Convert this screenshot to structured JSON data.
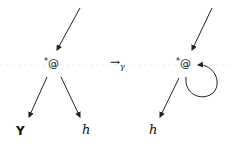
{
  "left_graph": {
    "node": {
      "star": "*",
      "symbol": "@"
    },
    "children": [
      {
        "label": "Y",
        "style": "bold"
      },
      {
        "label": "h",
        "style": "italic"
      }
    ]
  },
  "relation": {
    "arrow": "→",
    "subscript": "γ"
  },
  "right_graph": {
    "node": {
      "star": "*",
      "symbol": "@"
    },
    "children": [
      {
        "label": "h",
        "style": "italic"
      }
    ],
    "self_loop": true
  },
  "colors": {
    "stroke": "#222222",
    "baseline": "#eeeeee"
  }
}
